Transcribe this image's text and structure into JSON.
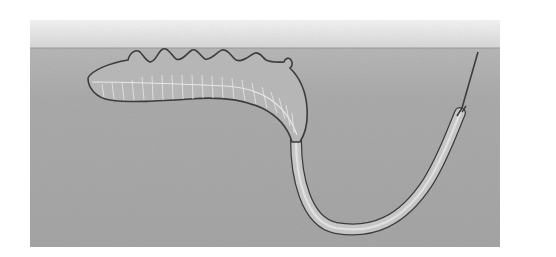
{
  "illustration": {
    "subject": "burrowing worm-like animal in sediment with tube extending to surface",
    "colors": {
      "page_background": "#ffffff",
      "surface_band_top": "#f2f2f2",
      "surface_band_bottom": "#dcdcdc",
      "sediment": "#a9a9a9",
      "body_fill": "#b4b4b4",
      "body_outline": "#3c3c3c",
      "segment_lines": "#e6e6e6",
      "tube_fill": "#c4c4c4",
      "tube_inner": "#dedede"
    },
    "frame": {
      "x": 30,
      "y": 20,
      "width": 470,
      "height": 227
    },
    "surface_line_y": 48,
    "siphon_tip": {
      "x": 478,
      "y": 52
    }
  }
}
